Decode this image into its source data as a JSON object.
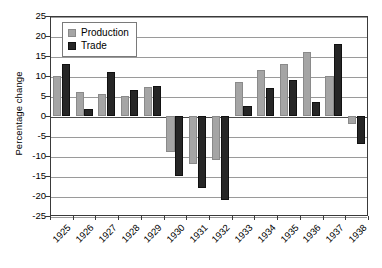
{
  "chart_data": {
    "type": "bar",
    "title": "",
    "xlabel": "",
    "ylabel": "Percentage change",
    "ylim": [
      -25,
      25
    ],
    "ytick_step": 5,
    "grid": true,
    "legend_position": "top-left",
    "categories": [
      "1925",
      "1926",
      "1927",
      "1928",
      "1929",
      "1930",
      "1931",
      "1932",
      "1933",
      "1934",
      "1935",
      "1936",
      "1937",
      "1938"
    ],
    "yticks": [
      "25",
      "20",
      "15",
      "10",
      "5",
      "0",
      "-5",
      "-10",
      "-15",
      "-20",
      "-25"
    ],
    "series": [
      {
        "name": "Production",
        "color": "#a5a5a5",
        "values": [
          10,
          6,
          5.5,
          5,
          7.2,
          -9,
          -12,
          -11,
          8.5,
          11.5,
          13,
          16,
          10,
          -2
        ]
      },
      {
        "name": "Trade",
        "color": "#262626",
        "values": [
          13,
          1.8,
          11,
          6.5,
          7.5,
          -15,
          -18,
          -21,
          2.5,
          7,
          9,
          3.5,
          18,
          -7
        ]
      }
    ]
  },
  "legend": {
    "entries": [
      {
        "label": "Production"
      },
      {
        "label": "Trade"
      }
    ]
  }
}
